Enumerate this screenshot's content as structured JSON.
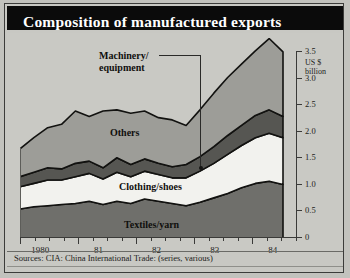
{
  "title": "Composition of manufactured exports",
  "source": "Sources: CIA: China International Trade: (series, various)",
  "axis": {
    "unit_line1": "US $",
    "unit_line2": "billion",
    "yticks": [
      "3.5",
      "3.0",
      "2.5",
      "2.0",
      "1.5",
      "1.0",
      "0.5",
      "0"
    ],
    "xlabels": [
      "1980",
      "81",
      "82",
      "83",
      "84"
    ]
  },
  "labels": {
    "machinery": "Machinery/",
    "machinery2": "equipment",
    "others": "Others",
    "clothing": "Clothing/shoes",
    "textiles": "Textiles/yarn"
  },
  "chart_data": {
    "type": "area",
    "title": "Composition of manufactured exports",
    "subtitle": "",
    "xlabel": "",
    "ylabel": "US $ billion",
    "ylim": [
      0,
      3.5
    ],
    "grid": false,
    "legend": "inline-band-labels",
    "stacked": true,
    "x": [
      "1980Q1",
      "1980Q2",
      "1980Q3",
      "1980Q4",
      "1981Q1",
      "1981Q2",
      "1981Q3",
      "1981Q4",
      "1982Q1",
      "1982Q2",
      "1982Q3",
      "1982Q4",
      "1983Q1",
      "1983Q2",
      "1983Q3",
      "1983Q4",
      "1984Q1",
      "1984Q2",
      "1984Q3",
      "1984Q4"
    ],
    "x_tick_labels": [
      "1980",
      "81",
      "82",
      "83",
      "84"
    ],
    "series": [
      {
        "name": "Textiles/yarn",
        "color": "#6f6f6b",
        "values": [
          0.52,
          0.56,
          0.58,
          0.6,
          0.62,
          0.66,
          0.6,
          0.66,
          0.62,
          0.7,
          0.66,
          0.62,
          0.58,
          0.64,
          0.72,
          0.8,
          0.9,
          0.98,
          1.02,
          0.96
        ]
      },
      {
        "name": "Clothing/shoes",
        "color": "#f2f2ee",
        "values": [
          0.4,
          0.42,
          0.46,
          0.44,
          0.48,
          0.5,
          0.46,
          0.52,
          0.48,
          0.5,
          0.48,
          0.46,
          0.5,
          0.56,
          0.62,
          0.7,
          0.76,
          0.82,
          0.86,
          0.84
        ]
      },
      {
        "name": "Machinery/equipment",
        "color": "#565652",
        "values": [
          0.18,
          0.2,
          0.22,
          0.2,
          0.24,
          0.22,
          0.2,
          0.26,
          0.22,
          0.22,
          0.2,
          0.2,
          0.24,
          0.26,
          0.3,
          0.34,
          0.36,
          0.4,
          0.42,
          0.38
        ]
      },
      {
        "name": "Others",
        "color": "#9d9d98",
        "values": [
          0.5,
          0.62,
          0.72,
          0.8,
          0.94,
          0.8,
          1.02,
          0.86,
          0.92,
          0.86,
          0.82,
          0.84,
          0.7,
          0.84,
          0.96,
          1.04,
          1.1,
          1.16,
          1.28,
          1.16
        ]
      }
    ]
  }
}
